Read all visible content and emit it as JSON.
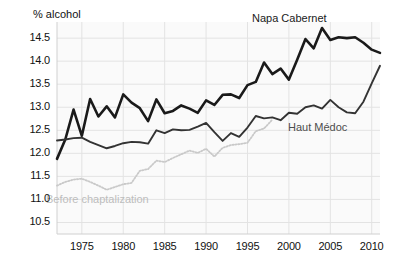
{
  "chart_data": {
    "type": "line",
    "title": "",
    "subtitle": "",
    "xlabel": "",
    "ylabel": "% alcohol",
    "axis_title": "% alcohol",
    "xlim": [
      1972,
      2011
    ],
    "ylim": [
      10.25,
      14.85
    ],
    "grid": true,
    "legend_position": "inline-annotations",
    "yticks": [
      "10.5",
      "11.0",
      "11.5",
      "12.0",
      "12.5",
      "13.0",
      "13.5",
      "14.0",
      "14.5"
    ],
    "ytick_values": [
      10.5,
      11.0,
      11.5,
      12.0,
      12.5,
      13.0,
      13.5,
      14.0,
      14.5
    ],
    "xticks": [
      "1975",
      "1980",
      "1985",
      "1990",
      "1995",
      "2000",
      "2005",
      "2010"
    ],
    "xtick_values": [
      1975,
      1980,
      1985,
      1990,
      1995,
      2000,
      2005,
      2010
    ],
    "annotations": [
      {
        "text": "Napa Cabernet",
        "series": "Napa Cabernet",
        "color": "#1a1a1a"
      },
      {
        "text": "Haut Médoc",
        "series": "Haut Médoc",
        "color": "#4d4d4d"
      },
      {
        "text": "Before chaptalization",
        "series": "Before chaptalization",
        "color": "#bdbdbd"
      }
    ],
    "series": [
      {
        "name": "Napa Cabernet",
        "color": "#1a1a1a",
        "style": "solid",
        "width": 2.6,
        "x": [
          1972,
          1973,
          1974,
          1975,
          1976,
          1977,
          1978,
          1979,
          1980,
          1981,
          1982,
          1983,
          1984,
          1985,
          1986,
          1987,
          1988,
          1989,
          1990,
          1991,
          1992,
          1993,
          1994,
          1995,
          1996,
          1997,
          1998,
          1999,
          2000,
          2001,
          2002,
          2003,
          2004,
          2005,
          2006,
          2007,
          2008,
          2009,
          2010,
          2011
        ],
        "values": [
          11.88,
          12.3,
          12.95,
          12.38,
          13.18,
          12.8,
          13.02,
          12.78,
          13.28,
          13.1,
          12.98,
          12.7,
          13.17,
          12.87,
          12.92,
          13.04,
          12.97,
          12.88,
          13.15,
          13.05,
          13.27,
          13.28,
          13.2,
          13.48,
          13.55,
          13.97,
          13.72,
          13.84,
          13.6,
          14.03,
          14.48,
          14.28,
          14.72,
          14.46,
          14.52,
          14.5,
          14.52,
          14.4,
          14.25,
          14.18
        ]
      },
      {
        "name": "Haut Médoc",
        "color": "#333333",
        "style": "solid",
        "width": 1.9,
        "x": [
          1972,
          1973,
          1974,
          1975,
          1976,
          1977,
          1978,
          1979,
          1980,
          1981,
          1982,
          1983,
          1984,
          1985,
          1986,
          1987,
          1988,
          1989,
          1990,
          1991,
          1992,
          1993,
          1994,
          1995,
          1996,
          1997,
          1998,
          1999,
          2000,
          2001,
          2002,
          2003,
          2004,
          2005,
          2006,
          2007,
          2008,
          2009,
          2010,
          2011
        ],
        "values": [
          12.28,
          12.3,
          12.33,
          12.34,
          12.25,
          12.18,
          12.11,
          12.16,
          12.22,
          12.25,
          12.24,
          12.21,
          12.5,
          12.44,
          12.52,
          12.5,
          12.51,
          12.58,
          12.66,
          12.46,
          12.27,
          12.44,
          12.36,
          12.56,
          12.81,
          12.76,
          12.78,
          12.72,
          12.88,
          12.86,
          13.0,
          13.04,
          12.97,
          13.16,
          13.0,
          12.89,
          12.87,
          13.12,
          13.52,
          13.9
        ]
      },
      {
        "name": "Before chaptalization",
        "color": "#c9c9c9",
        "style": "dotted",
        "width": 1.8,
        "x": [
          1972,
          1973,
          1974,
          1975,
          1976,
          1977,
          1978,
          1979,
          1980,
          1981,
          1982,
          1983,
          1984,
          1985,
          1986,
          1987,
          1988,
          1989,
          1990,
          1991,
          1992,
          1993,
          1994,
          1995,
          1996,
          1997,
          1998
        ],
        "values": [
          11.3,
          11.38,
          11.43,
          11.45,
          11.38,
          11.3,
          11.21,
          11.27,
          11.33,
          11.36,
          11.62,
          11.66,
          11.84,
          11.81,
          11.9,
          11.98,
          12.06,
          12.01,
          12.1,
          11.93,
          12.12,
          12.18,
          12.2,
          12.23,
          12.48,
          12.54,
          12.73
        ]
      }
    ]
  }
}
